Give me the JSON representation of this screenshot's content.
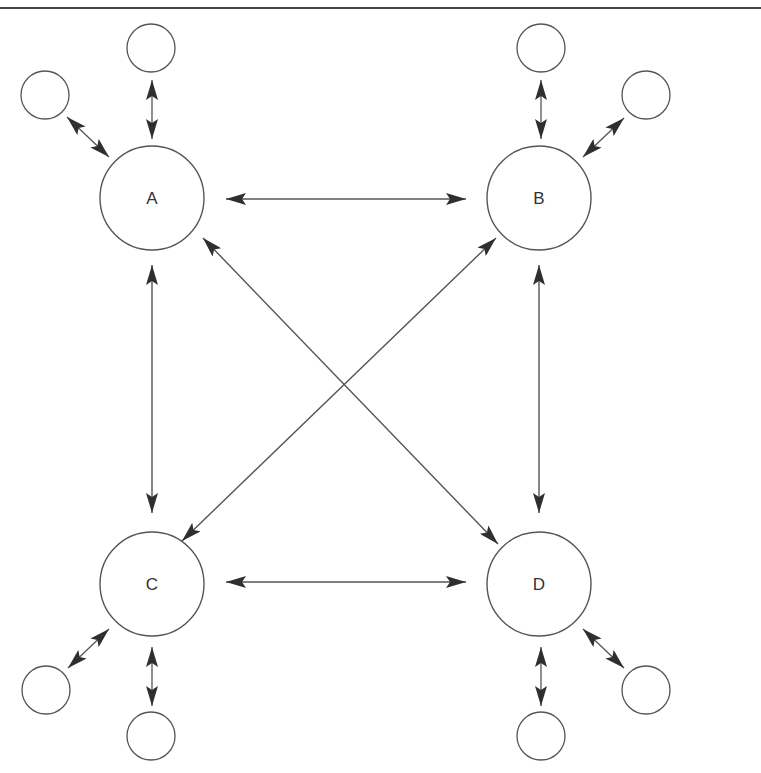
{
  "diagram": {
    "type": "network",
    "colors": {
      "stroke": "#555555",
      "arrow": "#333333",
      "background": "#ffffff",
      "border": "#444444"
    },
    "hubs": [
      {
        "id": "A",
        "label": "A",
        "cx": 152,
        "cy": 198,
        "r": 52
      },
      {
        "id": "B",
        "label": "B",
        "cx": 539,
        "cy": 198,
        "r": 52
      },
      {
        "id": "C",
        "label": "C",
        "cx": 152,
        "cy": 584,
        "r": 52
      },
      {
        "id": "D",
        "label": "D",
        "cx": 539,
        "cy": 584,
        "r": 52
      }
    ],
    "satellites": [
      {
        "id": "A-top",
        "hub": "A",
        "label": "",
        "cx": 151,
        "cy": 48,
        "r": 24
      },
      {
        "id": "A-left",
        "hub": "A",
        "label": "",
        "cx": 45,
        "cy": 95,
        "r": 24
      },
      {
        "id": "B-top",
        "hub": "B",
        "label": "",
        "cx": 541,
        "cy": 48,
        "r": 24
      },
      {
        "id": "B-right",
        "hub": "B",
        "label": "",
        "cx": 646,
        "cy": 95,
        "r": 24
      },
      {
        "id": "C-left",
        "hub": "C",
        "label": "",
        "cx": 46,
        "cy": 690,
        "r": 24
      },
      {
        "id": "C-bottom",
        "hub": "C",
        "label": "",
        "cx": 151,
        "cy": 736,
        "r": 24
      },
      {
        "id": "D-bottom",
        "hub": "D",
        "label": "",
        "cx": 541,
        "cy": 736,
        "r": 24
      },
      {
        "id": "D-right",
        "hub": "D",
        "label": "",
        "cx": 646,
        "cy": 690,
        "r": 24
      }
    ],
    "edges": [
      {
        "id": "A-B",
        "from": "A",
        "to": "B",
        "bidirectional": true,
        "x1": 226,
        "y1": 199,
        "x2": 466,
        "y2": 199
      },
      {
        "id": "C-D",
        "from": "C",
        "to": "D",
        "bidirectional": true,
        "x1": 226,
        "y1": 582,
        "x2": 466,
        "y2": 582
      },
      {
        "id": "A-C",
        "from": "A",
        "to": "C",
        "bidirectional": true,
        "x1": 152,
        "y1": 265,
        "x2": 152,
        "y2": 513
      },
      {
        "id": "B-D",
        "from": "B",
        "to": "D",
        "bidirectional": true,
        "x1": 539,
        "y1": 265,
        "x2": 539,
        "y2": 513
      },
      {
        "id": "A-D",
        "from": "A",
        "to": "D",
        "bidirectional": true,
        "x1": 203,
        "y1": 238,
        "x2": 498,
        "y2": 544
      },
      {
        "id": "B-C",
        "from": "B",
        "to": "C",
        "bidirectional": true,
        "x1": 496,
        "y1": 238,
        "x2": 182,
        "y2": 541
      },
      {
        "id": "A-Atop",
        "from": "A",
        "to": "A-top",
        "bidirectional": true,
        "x1": 152,
        "y1": 139,
        "x2": 152,
        "y2": 80
      },
      {
        "id": "A-Aleft",
        "from": "A",
        "to": "A-left",
        "bidirectional": true,
        "x1": 109,
        "y1": 157,
        "x2": 67,
        "y2": 117
      },
      {
        "id": "B-Btop",
        "from": "B",
        "to": "B-top",
        "bidirectional": true,
        "x1": 541,
        "y1": 139,
        "x2": 541,
        "y2": 80
      },
      {
        "id": "B-Bright",
        "from": "B",
        "to": "B-right",
        "bidirectional": true,
        "x1": 583,
        "y1": 157,
        "x2": 624,
        "y2": 118
      },
      {
        "id": "C-Cleft",
        "from": "C",
        "to": "C-left",
        "bidirectional": true,
        "x1": 109,
        "y1": 629,
        "x2": 68,
        "y2": 668
      },
      {
        "id": "C-Cbot",
        "from": "C",
        "to": "C-bottom",
        "bidirectional": true,
        "x1": 152,
        "y1": 647,
        "x2": 152,
        "y2": 706
      },
      {
        "id": "D-Dbot",
        "from": "D",
        "to": "D-bottom",
        "bidirectional": true,
        "x1": 541,
        "y1": 647,
        "x2": 541,
        "y2": 706
      },
      {
        "id": "D-Dright",
        "from": "D",
        "to": "D-right",
        "bidirectional": true,
        "x1": 583,
        "y1": 629,
        "x2": 624,
        "y2": 668
      }
    ],
    "top_border": {
      "y": 8,
      "thickness": 2
    }
  }
}
